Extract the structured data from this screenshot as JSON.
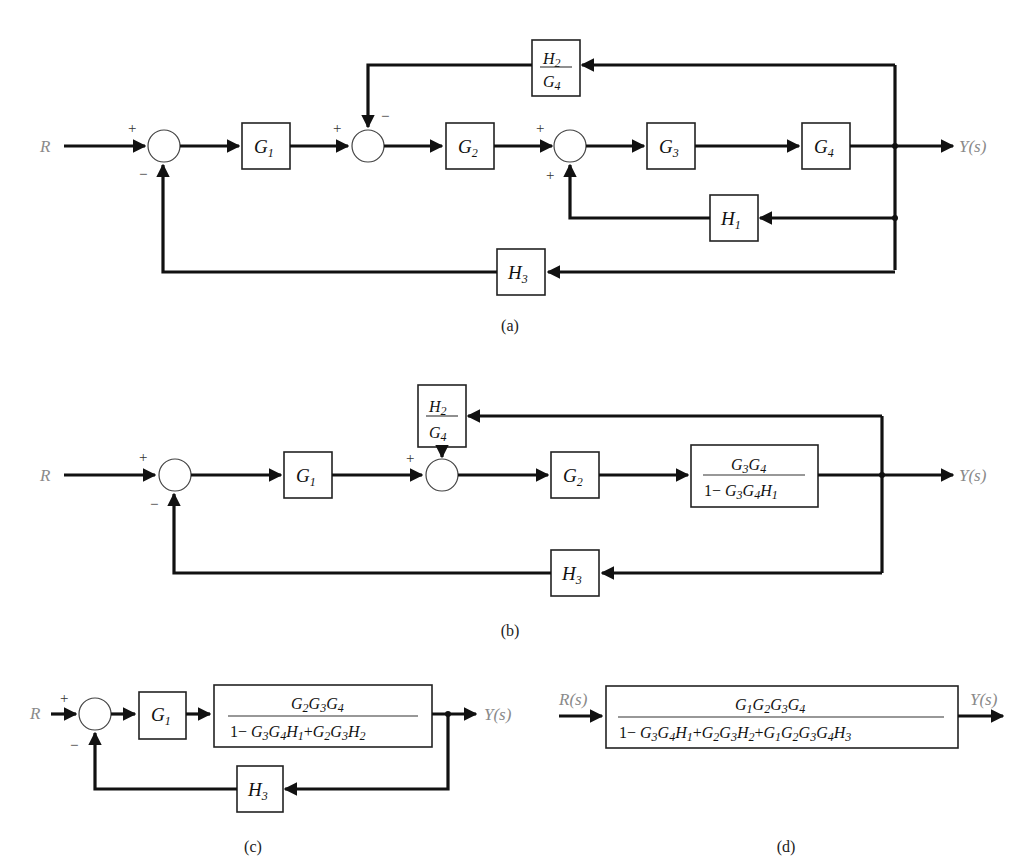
{
  "diagram": {
    "panels": [
      {
        "id": "a",
        "caption": "(a)",
        "input": "R",
        "output": "Y(s)",
        "blocks": [
          "G1",
          "G2",
          "G3",
          "G4",
          "H1",
          "H2/G4",
          "H3"
        ],
        "summing_junctions": [
          {
            "signs": [
              "+",
              "−"
            ]
          },
          {
            "signs": [
              "+",
              "−"
            ]
          },
          {
            "signs": [
              "+",
              "+"
            ]
          }
        ]
      },
      {
        "id": "b",
        "caption": "(b)",
        "input": "R",
        "output": "Y(s)",
        "blocks": [
          "G1",
          "G2",
          "G3G4 / (1 − G3G4H1)",
          "H2/G4",
          "H3"
        ]
      },
      {
        "id": "c",
        "caption": "(c)",
        "input": "R",
        "output": "Y(s)",
        "blocks": [
          "G1",
          "G2G3G4 / (1 − G3G4H1 + G2G3H2)",
          "H3"
        ]
      },
      {
        "id": "d",
        "caption": "(d)",
        "input": "R(s)",
        "output": "Y(s)",
        "blocks": [
          "G1G2G3G4 / (1 − G3G4H1 + G2G3H2 + G1G2G3G4H3)"
        ]
      }
    ]
  },
  "labels": {
    "R": "R",
    "Rs": "R(s)",
    "Ys": "Y(s)",
    "plus": "+",
    "minus": "−",
    "G": "G",
    "H": "H",
    "one_minus": "1−",
    "plus_op": "+",
    "n1": "1",
    "n2": "2",
    "n3": "3",
    "n4": "4",
    "cap_a": "(a)",
    "cap_b": "(b)",
    "cap_c": "(c)",
    "cap_d": "(d)"
  }
}
